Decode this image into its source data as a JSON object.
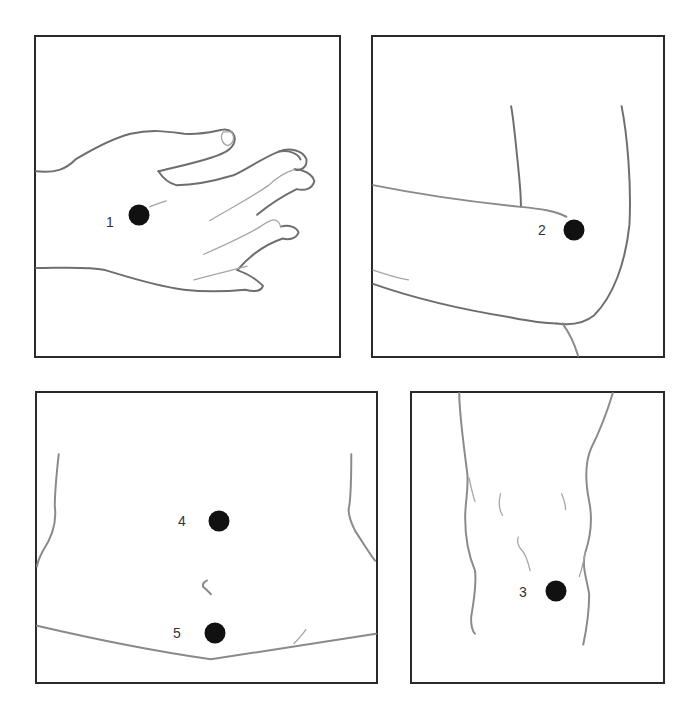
{
  "diagram": {
    "type": "injection-site-illustration",
    "panels": [
      {
        "id": "hand",
        "region": "back of hand",
        "sites": [
          {
            "number": "1"
          }
        ]
      },
      {
        "id": "upper-arm",
        "region": "upper arm / elbow",
        "sites": [
          {
            "number": "2"
          }
        ]
      },
      {
        "id": "abdomen",
        "region": "abdomen",
        "sites": [
          {
            "number": "4"
          },
          {
            "number": "5"
          }
        ]
      },
      {
        "id": "thigh",
        "region": "thigh",
        "sites": [
          {
            "number": "3"
          }
        ]
      }
    ]
  },
  "colors": {
    "border": "#2a2a2a",
    "dot": "#111111",
    "label": "#333333",
    "line": "#8a8a8a",
    "background": "#ffffff"
  }
}
